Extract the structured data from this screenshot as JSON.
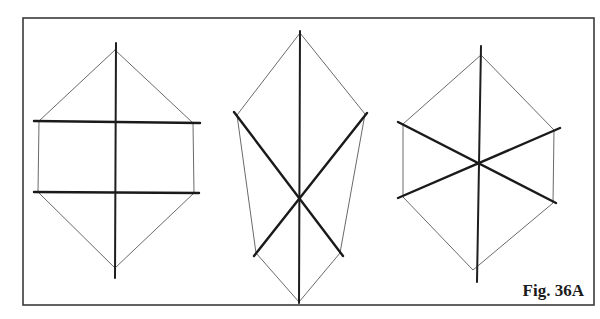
{
  "caption": "Fig. 36A",
  "colors": {
    "background": "#ffffff",
    "ink": "#1a1a1a",
    "light_ink": "#6a6a6a"
  },
  "frame": {
    "x1": 23,
    "y1": 18,
    "x2": 594,
    "y2": 305
  },
  "figures": [
    {
      "id": "hexagon-horizontal-bars",
      "description": "Hexagon with vertical axis and two parallel horizontal bold lines",
      "axis": [
        [
          116,
          43
        ],
        [
          115,
          278
        ]
      ],
      "bold_lines": [
        [
          [
            34,
            121
          ],
          [
            200,
            123
          ]
        ],
        [
          [
            34,
            192
          ],
          [
            199,
            193
          ]
        ]
      ],
      "outline": [
        [
          115,
          50
        ],
        [
          193,
          123
        ],
        [
          194,
          193
        ],
        [
          115,
          268
        ],
        [
          38,
          192
        ],
        [
          39,
          121
        ],
        [
          115,
          50
        ]
      ]
    },
    {
      "id": "elongated-hexagon-x-cross",
      "description": "Elongated hexagon with vertical axis and bold X crossing below center",
      "axis": [
        [
          300,
          31
        ],
        [
          299,
          303
        ]
      ],
      "bold_lines": [
        [
          [
            234,
            112
          ],
          [
            343,
            256
          ]
        ],
        [
          [
            367,
            113
          ],
          [
            254,
            256
          ]
        ]
      ],
      "outline": [
        [
          300,
          33
        ],
        [
          365,
          114
        ],
        [
          340,
          253
        ],
        [
          299,
          302
        ],
        [
          256,
          253
        ],
        [
          237,
          115
        ],
        [
          300,
          33
        ]
      ]
    },
    {
      "id": "hexagon-six-spokes",
      "description": "Hexagon with vertical axis and two bold diagonals crossing at center",
      "axis": [
        [
          481,
          46
        ],
        [
          477,
          282
        ]
      ],
      "bold_lines": [
        [
          [
            398,
            122
          ],
          [
            556,
            203
          ]
        ],
        [
          [
            398,
            198
          ],
          [
            560,
            128
          ]
        ]
      ],
      "outline": [
        [
          481,
          55
        ],
        [
          554,
          130
        ],
        [
          553,
          203
        ],
        [
          473,
          270
        ],
        [
          403,
          197
        ],
        [
          403,
          124
        ],
        [
          481,
          55
        ]
      ]
    }
  ]
}
